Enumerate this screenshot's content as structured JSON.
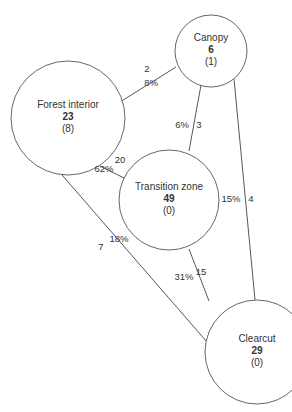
{
  "diagram": {
    "nodes": [
      {
        "id": "canopy",
        "name": "Canopy",
        "count": "6",
        "sub": "(1)",
        "cx": 211,
        "cy": 51,
        "r": 36
      },
      {
        "id": "forest-interior",
        "name": "Forest interior",
        "count": "23",
        "sub": "(8)",
        "cx": 68,
        "cy": 118,
        "r": 57
      },
      {
        "id": "transition-zone",
        "name": "Transition zone",
        "count": "49",
        "sub": "(0)",
        "cx": 169,
        "cy": 200,
        "r": 50
      },
      {
        "id": "clearcut",
        "name": "Clearcut",
        "count": "29",
        "sub": "(0)",
        "cx": 257,
        "cy": 352,
        "r": 52
      }
    ],
    "edges": [
      {
        "id": "forest-interior-canopy",
        "from": "Forest interior",
        "to": "Canopy",
        "count": "2",
        "percent": "8%",
        "line": [
          120,
          102,
          176,
          67
        ],
        "count_pos": [
          147,
          72
        ],
        "percent_pos": [
          151,
          86
        ]
      },
      {
        "id": "canopy-transition-zone",
        "from": "Canopy",
        "to": "Transition zone",
        "count": "3",
        "percent": "6%",
        "line": [
          201,
          85,
          189,
          151
        ],
        "count_pos": [
          199,
          128
        ],
        "percent_pos": [
          182,
          128
        ]
      },
      {
        "id": "canopy-clearcut",
        "from": "Canopy",
        "to": "Clearcut",
        "count": "4",
        "percent": "15%",
        "line": [
          234,
          79,
          255,
          300
        ],
        "count_pos": [
          251,
          202
        ],
        "percent_pos": [
          231,
          202
        ]
      },
      {
        "id": "forest-interior-transition-zone",
        "from": "Forest interior",
        "to": "Transition zone",
        "count": "20",
        "percent": "62%",
        "line": [
          100,
          166,
          128,
          180
        ],
        "count_pos": [
          120,
          163
        ],
        "percent_pos": [
          104,
          172
        ]
      },
      {
        "id": "forest-interior-clearcut",
        "from": "Forest interior",
        "to": "Clearcut",
        "count": "7",
        "percent": "18%",
        "line": [
          49,
          160,
          207,
          342
        ],
        "count_pos": [
          101,
          250
        ],
        "percent_pos": [
          119,
          242
        ]
      },
      {
        "id": "transition-zone-clearcut",
        "from": "Transition zone",
        "to": "Clearcut",
        "count": "15",
        "percent": "31%",
        "line": [
          189,
          249,
          209,
          301
        ],
        "count_pos": [
          201,
          275
        ],
        "percent_pos": [
          184,
          280
        ]
      }
    ]
  }
}
